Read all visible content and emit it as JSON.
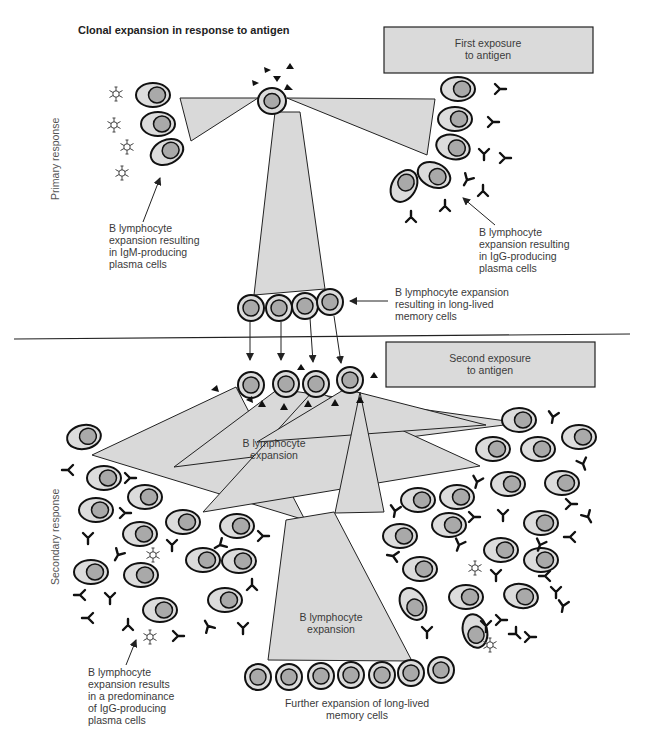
{
  "title": "Clonal expansion in response to antigen",
  "side_labels": {
    "primary": "Primary response",
    "secondary": "Secondary response"
  },
  "boxes": {
    "first_exposure": [
      "First exposure",
      "to antigen"
    ],
    "second_exposure": [
      "Second exposure",
      "to antigen"
    ]
  },
  "labels": {
    "igm": [
      "B lymphocyte",
      "expansion resulting",
      "in IgM-producing",
      "plasma cells"
    ],
    "igg": [
      "B lymphocyte",
      "expansion resulting",
      "in IgG-producing",
      "plasma cells"
    ],
    "memory": [
      "B lymphocyte expansion",
      "resulting in long-lived",
      "memory cells"
    ],
    "secondary_expansion": [
      "B lymphocyte",
      "expansion"
    ],
    "bottom_expansion": [
      "B lymphocyte",
      "expansion"
    ],
    "predominance": [
      "B lymphocyte",
      "expansion results",
      "in a predominance",
      "of IgG-producing",
      "plasma cells"
    ],
    "further_memory": [
      "Further expansion of long-lived",
      "memory cells"
    ]
  },
  "legend_symbols": {
    "antigen": "black-triangle",
    "antibody": "Y-shape",
    "IgM": "pentamer-star",
    "cell": "plasma-cell-oval"
  },
  "colors": {
    "cone_fill": "#d9d9d9",
    "cell_fill": "#dcdcdc",
    "nucleus_fill": "#a9a9a9",
    "outline": "#111111",
    "text": "#3a3a3a"
  }
}
